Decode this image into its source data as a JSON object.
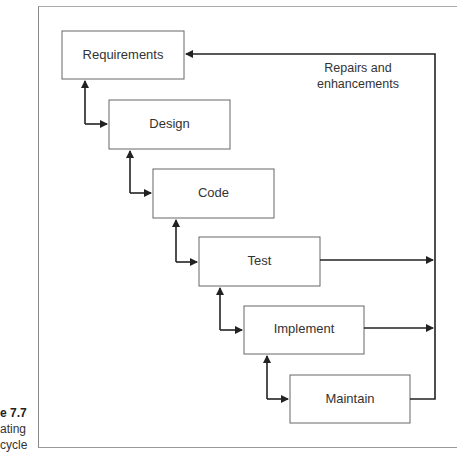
{
  "caption": {
    "figure_label": "e 7.7",
    "lines": [
      "ating",
      "cycle"
    ]
  },
  "stages": [
    {
      "label": "Requirements"
    },
    {
      "label": "Design"
    },
    {
      "label": "Code"
    },
    {
      "label": "Test"
    },
    {
      "label": "Implement"
    },
    {
      "label": "Maintain"
    }
  ],
  "feedback_note": {
    "line1": "Repairs and",
    "line2": "enhancements"
  }
}
